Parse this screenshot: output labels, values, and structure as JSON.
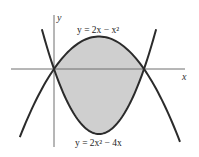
{
  "figure": {
    "axes": {
      "x_label": "x",
      "y_label": "y"
    },
    "curves": [
      {
        "id": "upper",
        "label": "y = 2x − x²",
        "equation": "2x - x^2",
        "x_range": [
          -0.76,
          2.8
        ]
      },
      {
        "id": "lower",
        "label": "y = 2x² − 4x",
        "equation": "2x^2 - 4x",
        "x_range": [
          -0.27,
          2.27
        ]
      }
    ],
    "intersections": [
      [
        0,
        0
      ],
      [
        2,
        0
      ]
    ],
    "shaded_region": {
      "between": [
        "upper",
        "lower"
      ],
      "x_from": 0,
      "x_to": 2
    },
    "colors": {
      "shade": "#cfcfcf",
      "curve": "#2b2b2b",
      "axis": "#6e6e6e"
    }
  }
}
